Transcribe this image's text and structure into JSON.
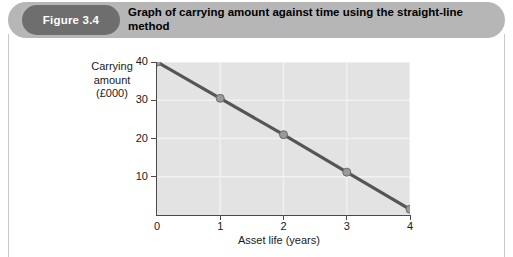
{
  "figure": {
    "badge_label": "Figure 3.4",
    "title": "Graph of carrying amount against time using the straight-line method",
    "badge_color": "#6e6e6e",
    "header_color": "#b6b6b6"
  },
  "chart_data": {
    "type": "line",
    "title": "Graph of carrying amount against time using the straight-line method",
    "xlabel": "Asset life (years)",
    "ylabel": "Carrying amount (£000)",
    "ylabel_lines": [
      "Carrying",
      "amount",
      "(£000)"
    ],
    "x": [
      0,
      1,
      2,
      3,
      4
    ],
    "values": [
      40,
      30.5,
      21,
      11.2,
      1.5
    ],
    "xticks": [
      "0",
      "1",
      "2",
      "3",
      "4"
    ],
    "yticks": [
      "10",
      "20",
      "30",
      "40"
    ],
    "xlim": [
      0,
      4
    ],
    "ylim": [
      0,
      40
    ],
    "grid": true,
    "legend": "none",
    "series_color": "#555555",
    "marker_color": "#9a9a9a",
    "plot_background": "#e3e3e3",
    "gridline_color": "#f2f2f2"
  }
}
